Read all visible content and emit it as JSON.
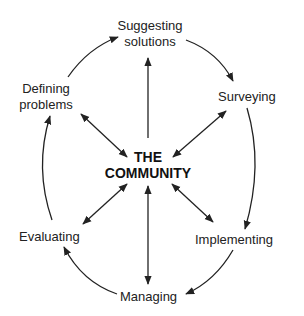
{
  "diagram": {
    "center": {
      "line1": "THE",
      "line2": "COMMUNITY"
    },
    "nodes": {
      "suggesting": {
        "line1": "Suggesting",
        "line2": "solutions"
      },
      "surveying": {
        "label": "Surveying"
      },
      "implementing": {
        "label": "Implementing"
      },
      "managing": {
        "label": "Managing"
      },
      "evaluating": {
        "label": "Evaluating"
      },
      "defining": {
        "line1": "Defining",
        "line2": "problems"
      }
    },
    "cycle_order": [
      "Defining problems",
      "Suggesting solutions",
      "Surveying",
      "Implementing",
      "Managing",
      "Evaluating"
    ],
    "center_links": [
      {
        "to": "Suggesting solutions",
        "direction": "to-node"
      },
      {
        "to": "Surveying",
        "direction": "bidirectional"
      },
      {
        "to": "Implementing",
        "direction": "bidirectional"
      },
      {
        "to": "Managing",
        "direction": "bidirectional"
      },
      {
        "to": "Evaluating",
        "direction": "bidirectional"
      },
      {
        "to": "Defining problems",
        "direction": "bidirectional"
      }
    ]
  }
}
